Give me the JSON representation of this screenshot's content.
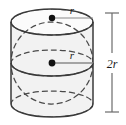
{
  "figure": {
    "name": "cylinder-with-inscribed-sphere",
    "solid_type": "cylinder",
    "inscribed_solid": "sphere",
    "colors": {
      "background": "#ffffff",
      "outline": "#3a3a3a",
      "fill": "#f2f2f2",
      "fill_top": "#fbfbfb",
      "dashed": "#4a4a4a",
      "dimension_line": "#6b6b6b",
      "leader_line": "#8a8a8a",
      "dot": "#111111",
      "text": "#1a1a1a"
    }
  },
  "labels": {
    "top_radius": "r",
    "center_radius": "r",
    "height_number": "2",
    "height_symbol": "r",
    "height_full": "2r"
  },
  "geometry": {
    "cylinder": {
      "center_x": 52,
      "left_x": 11,
      "right_x": 93,
      "radius_x": 41,
      "top_ellipse_cy": 22,
      "bottom_ellipse_cy": 104,
      "ellipse_ry": 13,
      "height": 82
    },
    "sphere": {
      "center_x": 52,
      "center_y": 63,
      "radius": 41,
      "equator_ry": 13
    },
    "dimension": {
      "x": 112,
      "top_y": 13,
      "bottom_y": 112,
      "tick_half_width": 7,
      "label_y": 66
    },
    "top_dot": {
      "x": 52,
      "y": 18,
      "r": 3.2
    },
    "center_dot": {
      "x": 52,
      "y": 63,
      "r": 3.4
    },
    "top_leader": {
      "x1": 52,
      "y1": 18,
      "x2": 93,
      "y2": 18
    },
    "center_leader": {
      "x1": 52,
      "y1": 63,
      "x2": 93,
      "y2": 63
    },
    "top_label_pos": {
      "x": 72,
      "y": 14
    },
    "center_label_pos": {
      "x": 72,
      "y": 59
    }
  }
}
